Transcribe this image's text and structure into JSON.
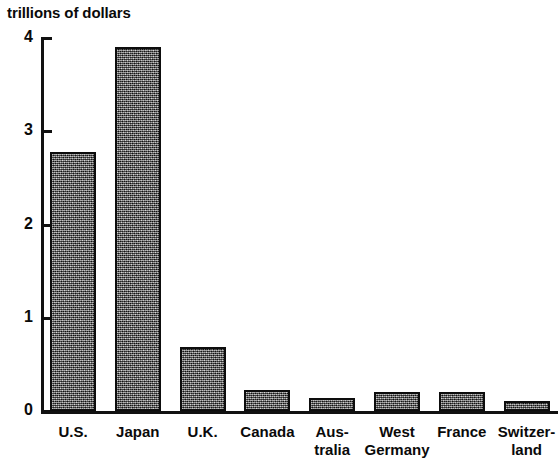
{
  "chart_data": {
    "type": "bar",
    "title": "trillions of dollars",
    "xlabel": "",
    "ylabel": "trillions of dollars",
    "ylim": [
      0,
      4
    ],
    "yticks": [
      0,
      1,
      2,
      3,
      4
    ],
    "ytick_labels": [
      "0",
      "1",
      "2",
      "3",
      "4"
    ],
    "grid": false,
    "legend": null,
    "categories": [
      "U.S.",
      "Japan",
      "U.K.",
      "Canada",
      "Aus-\ntralia",
      "West\nGermany",
      "France",
      "Switzer-\nland"
    ],
    "values": [
      2.78,
      3.9,
      0.69,
      0.23,
      0.14,
      0.2,
      0.2,
      0.11
    ],
    "bar_fill": "#4a4a4a",
    "bar_edge": "#0d0d0d",
    "axis_color": "#111111"
  }
}
